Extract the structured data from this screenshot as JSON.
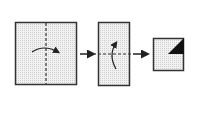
{
  "diagram": {
    "type": "origami-fold-sequence",
    "steps": [
      {
        "shape": "square",
        "fold_line": "vertical-dashed",
        "arrow": "fold-right"
      },
      {
        "shape": "rectangle",
        "fold_line": "horizontal-dashed",
        "arrow": "fold-up"
      },
      {
        "shape": "small-square",
        "mark": "black-triangle-top-right"
      }
    ],
    "connectors": [
      "arrow-right",
      "arrow-right"
    ],
    "colors": {
      "stroke": "#222222",
      "fill": "#ebebeb",
      "accent": "#111111"
    }
  }
}
